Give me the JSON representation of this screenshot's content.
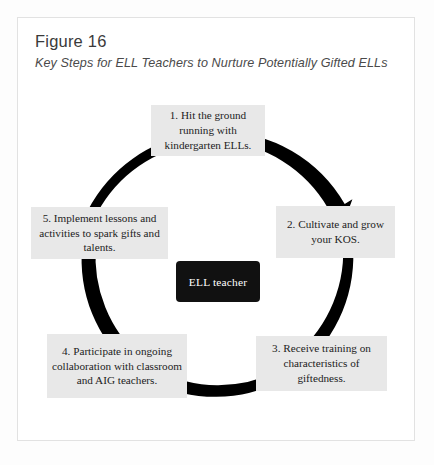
{
  "figure": {
    "title": "Figure 16",
    "subtitle": "Key Steps for ELL Teachers to Nurture Potentially Gifted ELLs"
  },
  "diagram": {
    "type": "cycle",
    "center": {
      "label": "ELL teacher",
      "background": "#111111",
      "text_color": "#ffffff"
    },
    "ring": {
      "color": "#000000",
      "stroke_width": 9,
      "segments": 5,
      "direction": "clockwise",
      "arrowheads": 5
    },
    "box_style": {
      "background": "#e8e8e8",
      "text_color": "#1c1c1c"
    },
    "steps": [
      {
        "number": "1",
        "text": "1. Hit the ground running with kindergarten ELLs.",
        "position": "top"
      },
      {
        "number": "2",
        "text": "2. Cultivate and grow your KOS.",
        "position": "upper-right"
      },
      {
        "number": "3",
        "text": "3. Receive training on characteristics of giftedness.",
        "position": "lower-right"
      },
      {
        "number": "4",
        "text": "4. Participate in ongoing collaboration with classroom and AIG teachers.",
        "position": "lower-left"
      },
      {
        "number": "5",
        "text": "5. Implement lessons and activities to spark gifts and talents.",
        "position": "upper-left"
      }
    ]
  }
}
